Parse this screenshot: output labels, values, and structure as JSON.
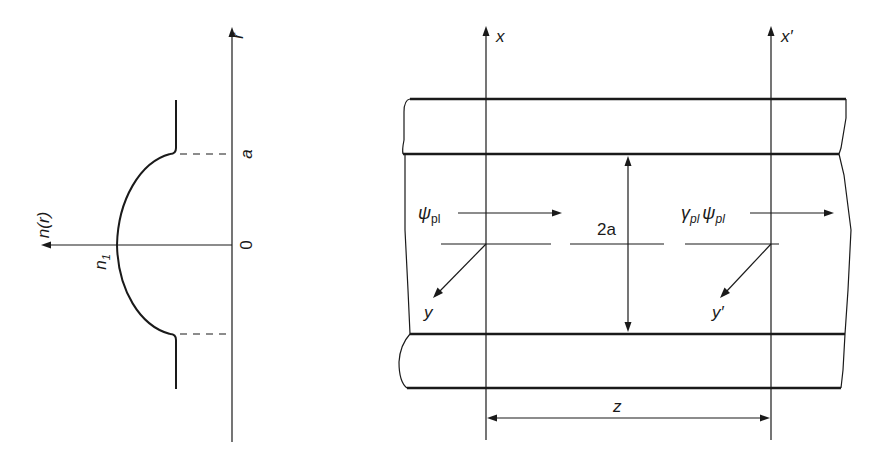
{
  "profile_plot": {
    "vertical_axis_label": "r",
    "horizontal_axis_label": "n(r)",
    "tick_labels": {
      "a": "a",
      "zero": "0"
    },
    "core_index_label": "n",
    "core_index_subscript": "1"
  },
  "waveguide": {
    "axis_left_label": "x",
    "axis_right_label": "x′",
    "transverse_left_label": "y",
    "transverse_right_label": "y′",
    "input_field_label": "ψ",
    "input_field_subscript": "pl",
    "output_coeff_label": "γ",
    "output_coeff_subscript": "pl",
    "output_field_label": "ψ",
    "output_field_subscript": "pl",
    "core_width_label": "2a",
    "propagation_length_label": "z"
  },
  "colors": {
    "ink": "#1a1a1a",
    "background": "#ffffff"
  }
}
